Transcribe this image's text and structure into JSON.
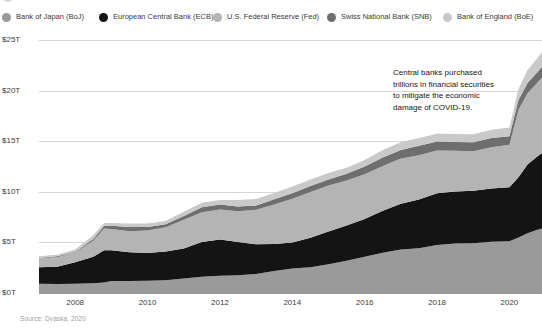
{
  "title": {
    "text": "CENTRAL BANK BALANCE SHEETS",
    "bullet_icon": "bullet-dot-icon"
  },
  "legend": {
    "position": "top",
    "items": [
      {
        "label": "Bank of Japan (BoJ)",
        "color": "#9a9a9a",
        "key": "boj",
        "x": 2
      },
      {
        "label": "European Central Bank (ECB)",
        "color": "#141414",
        "key": "ecb",
        "x": 99
      },
      {
        "label": "U.S. Federal Reserve (Fed)",
        "color": "#b4b4b4",
        "key": "fed",
        "x": 213
      },
      {
        "label": "Swiss National Bank (SNB)",
        "color": "#6e6e6e",
        "key": "snb",
        "x": 327
      },
      {
        "label": "Bank of England (BoE)",
        "color": "#c9c9c9",
        "key": "boe",
        "x": 443
      }
    ]
  },
  "source": "Source: Dvaska, 2020",
  "annotation": {
    "lines": [
      "Central banks purchased",
      "trillions in financial securities",
      "to mitigate the economic",
      "damage of COVID-19."
    ]
  },
  "axes": {
    "y_ticks": [
      "$25T",
      "$20T",
      "$15T",
      "$10T",
      "$5T",
      "$0T"
    ],
    "x_ticks": [
      "2008",
      "2010",
      "2012",
      "2014",
      "2016",
      "2018",
      "2020"
    ]
  },
  "chart_data": {
    "type": "area",
    "stacked": true,
    "title": "CENTRAL BANK BALANCE SHEETS",
    "xlabel": "",
    "ylabel": "Total assets (US$ trillions)",
    "ylim": [
      0,
      25
    ],
    "xlim": [
      2007.0,
      2020.9
    ],
    "grid": true,
    "legend_position": "top",
    "y_tick_values": [
      0,
      5,
      10,
      15,
      20,
      25
    ],
    "y_tick_labels": [
      "$0T",
      "$5T",
      "$10T",
      "$15T",
      "$20T",
      "$25T"
    ],
    "x_tick_values": [
      2008,
      2010,
      2012,
      2014,
      2016,
      2018,
      2020
    ],
    "x_tick_labels": [
      "2008",
      "2010",
      "2012",
      "2014",
      "2016",
      "2018",
      "2020"
    ],
    "x": [
      2007.0,
      2007.5,
      2008.0,
      2008.5,
      2008.8,
      2009.0,
      2009.5,
      2010.0,
      2010.5,
      2011.0,
      2011.5,
      2012.0,
      2012.5,
      2013.0,
      2013.5,
      2014.0,
      2014.5,
      2015.0,
      2015.5,
      2016.0,
      2016.5,
      2017.0,
      2017.5,
      2018.0,
      2018.5,
      2019.0,
      2019.5,
      2020.0,
      2020.25,
      2020.5,
      2020.75,
      2020.9
    ],
    "series": [
      {
        "name": "Bank of Japan (BoJ)",
        "color": "#9a9a9a",
        "values": [
          0.9,
          0.9,
          0.95,
          1.0,
          1.1,
          1.2,
          1.2,
          1.25,
          1.3,
          1.4,
          1.6,
          1.65,
          1.7,
          1.85,
          2.1,
          2.4,
          2.6,
          2.9,
          3.2,
          3.6,
          4.0,
          4.3,
          4.5,
          4.7,
          4.8,
          4.9,
          5.0,
          5.1,
          5.4,
          5.9,
          6.2,
          6.4
        ]
      },
      {
        "name": "European Central Bank (ECB)",
        "color": "#141414",
        "values": [
          1.7,
          1.8,
          2.1,
          2.6,
          3.1,
          3.0,
          2.8,
          2.7,
          2.8,
          3.0,
          3.5,
          3.6,
          3.3,
          3.0,
          2.7,
          2.6,
          2.9,
          3.2,
          3.4,
          3.7,
          4.1,
          4.5,
          4.8,
          5.1,
          5.2,
          5.2,
          5.3,
          5.4,
          6.0,
          6.8,
          7.3,
          7.5
        ]
      },
      {
        "name": "U.S. Federal Reserve (Fed)",
        "color": "#b4b4b4",
        "values": [
          0.9,
          0.9,
          0.95,
          1.6,
          2.2,
          2.1,
          2.1,
          2.3,
          2.4,
          2.9,
          2.9,
          2.9,
          3.0,
          3.4,
          3.9,
          4.3,
          4.5,
          4.5,
          4.5,
          4.5,
          4.5,
          4.5,
          4.4,
          4.3,
          4.1,
          3.9,
          4.0,
          4.2,
          6.6,
          7.0,
          7.2,
          7.4
        ]
      },
      {
        "name": "Swiss National Bank (SNB)",
        "color": "#6e6e6e",
        "values": [
          0.1,
          0.1,
          0.1,
          0.15,
          0.25,
          0.3,
          0.35,
          0.3,
          0.3,
          0.35,
          0.45,
          0.5,
          0.5,
          0.5,
          0.55,
          0.6,
          0.65,
          0.65,
          0.65,
          0.7,
          0.75,
          0.8,
          0.85,
          0.85,
          0.8,
          0.85,
          0.9,
          0.9,
          1.0,
          1.05,
          1.1,
          1.1
        ]
      },
      {
        "name": "Bank of England (BoE)",
        "color": "#c9c9c9",
        "values": [
          0.15,
          0.15,
          0.2,
          0.3,
          0.35,
          0.35,
          0.35,
          0.35,
          0.35,
          0.4,
          0.45,
          0.5,
          0.55,
          0.6,
          0.6,
          0.6,
          0.6,
          0.6,
          0.6,
          0.65,
          0.75,
          0.8,
          0.8,
          0.8,
          0.8,
          0.8,
          0.8,
          0.85,
          1.0,
          1.2,
          1.3,
          1.35
        ]
      }
    ],
    "annotations": [
      {
        "text": "Central banks purchased trillions in financial securities to mitigate the economic damage of COVID-19.",
        "x": 2019.2,
        "y": 20.5
      }
    ]
  }
}
